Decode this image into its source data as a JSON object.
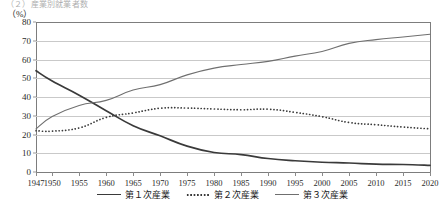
{
  "header": {
    "caption": "（２）産業別就業者数",
    "unit_label": "（%）"
  },
  "legend": {
    "position": "bottom-center",
    "items": [
      {
        "label": "第１次産業",
        "style": "solid",
        "color": "#3a3a3a"
      },
      {
        "label": "第２次産業",
        "style": "dotted",
        "color": "#3a3a3a"
      },
      {
        "label": "第３次産業",
        "style": "solid-thin",
        "color": "#6f6f6f"
      }
    ]
  },
  "chart_data": {
    "type": "line",
    "title": "（２）産業別就業者数",
    "xlabel": "",
    "ylabel": "（%）",
    "ylim": [
      0,
      80
    ],
    "ytick_step": 10,
    "yticks": [
      0,
      10,
      20,
      30,
      40,
      50,
      60,
      70,
      80
    ],
    "grid": true,
    "xlim": [
      1947,
      2020
    ],
    "categories": [
      1947,
      1950,
      1955,
      1960,
      1965,
      1970,
      1975,
      1980,
      1985,
      1990,
      1995,
      2000,
      2005,
      2010,
      2015,
      2020
    ],
    "xtick_labels": [
      "1947",
      "1950",
      "1955",
      "1960",
      "1965",
      "1970",
      "1975",
      "1980",
      "1985",
      "1990",
      "1995",
      "2000",
      "2005",
      "2010",
      "2015",
      "2020"
    ],
    "series": [
      {
        "name": "第１次産業",
        "style": "solid",
        "color": "#3a3a3a",
        "x": [
          1947,
          1950,
          1955,
          1960,
          1965,
          1970,
          1975,
          1980,
          1985,
          1990,
          1995,
          2000,
          2005,
          2010,
          2015,
          2020
        ],
        "values": [
          54.0,
          48.5,
          41.0,
          32.7,
          24.7,
          19.3,
          13.8,
          10.4,
          9.3,
          7.2,
          6.0,
          5.2,
          4.8,
          4.2,
          4.0,
          3.5
        ]
      },
      {
        "name": "第２次産業",
        "style": "dotted",
        "color": "#3a3a3a",
        "x": [
          1947,
          1950,
          1955,
          1960,
          1965,
          1970,
          1975,
          1980,
          1985,
          1990,
          1995,
          2000,
          2005,
          2010,
          2015,
          2020
        ],
        "values": [
          22.0,
          21.8,
          23.5,
          29.1,
          31.5,
          34.0,
          34.1,
          33.6,
          33.2,
          33.5,
          31.8,
          29.5,
          26.4,
          25.2,
          24.0,
          23.0
        ]
      },
      {
        "name": "第３次産業",
        "style": "solid-thin",
        "color": "#6f6f6f",
        "x": [
          1947,
          1950,
          1955,
          1960,
          1965,
          1970,
          1975,
          1980,
          1985,
          1990,
          1995,
          2000,
          2005,
          2010,
          2015,
          2020
        ],
        "values": [
          23.0,
          29.6,
          35.5,
          38.2,
          43.7,
          46.6,
          51.8,
          55.4,
          57.3,
          59.0,
          61.8,
          64.3,
          68.6,
          70.6,
          72.0,
          73.5
        ]
      }
    ]
  }
}
